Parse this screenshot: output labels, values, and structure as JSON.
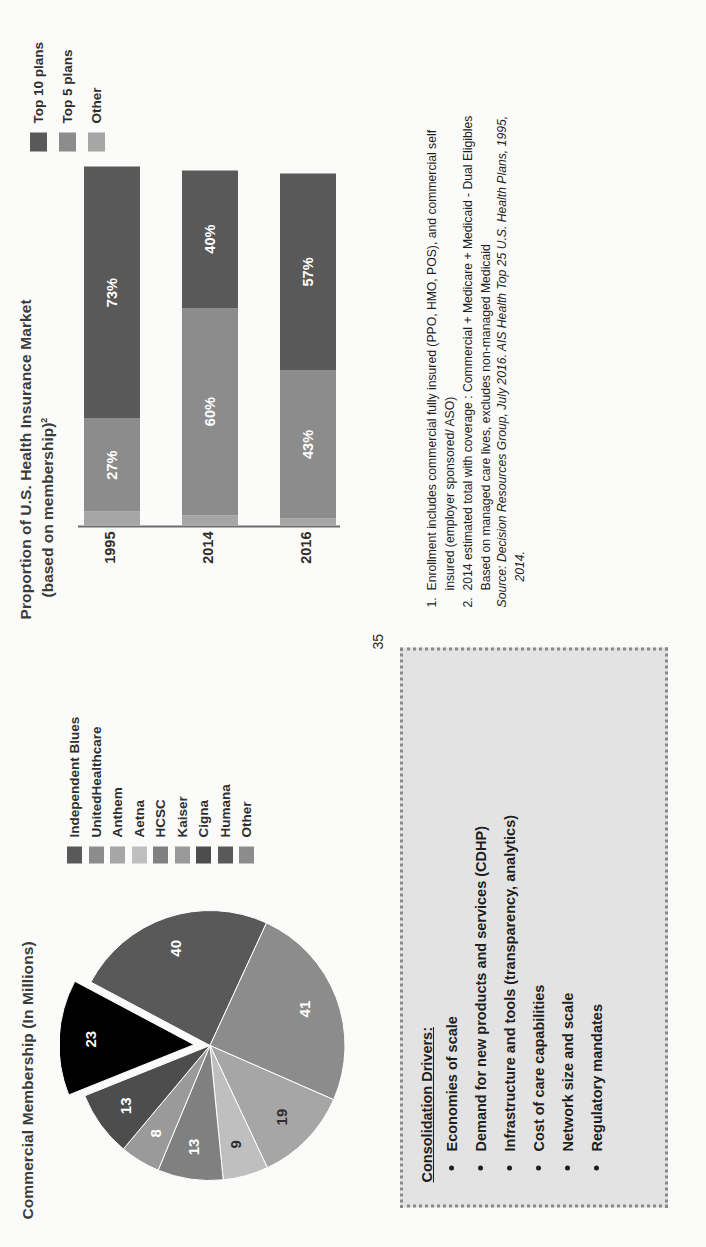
{
  "page_number": "35",
  "pie_panel": {
    "title": "Commercial Membership (In Millions)",
    "legend": [
      {
        "label": "Independent Blues",
        "color": "#595959"
      },
      {
        "label": "UnitedHealthcare",
        "color": "#8c8c8c"
      },
      {
        "label": "Anthem",
        "color": "#a6a6a6"
      },
      {
        "label": "Aetna",
        "color": "#bfbfbf"
      },
      {
        "label": "HCSC",
        "color": "#808080"
      },
      {
        "label": "Kaiser",
        "color": "#9a9a9a"
      },
      {
        "label": "Cigna",
        "color": "#4d4d4d"
      },
      {
        "label": "Humana",
        "color": "#595959"
      },
      {
        "label": "Other",
        "color": "#8c8c8c"
      }
    ]
  },
  "bar_panel": {
    "title": "Proportion of U.S. Health Insurance Market",
    "subtitle": "(based on membership)",
    "subtitle_sup": "2",
    "legend": [
      {
        "label": "Top 10 plans",
        "color": "#595959"
      },
      {
        "label": "Top 5 plans",
        "color": "#8c8c8c"
      },
      {
        "label": "Other",
        "color": "#a6a6a6"
      }
    ]
  },
  "drivers": {
    "heading": "Consolidation Drivers:",
    "items": [
      "Economies of scale",
      "Demand for new products and services (CDHP)",
      "Infrastructure and tools (transparency, analytics)",
      "Cost of care capabilities",
      "Network size and scale",
      "Regulatory mandates"
    ]
  },
  "footnotes": [
    {
      "num": "1.",
      "text": "Enrollment includes commercial fully insured (PPO, HMO, POS), and commercial self",
      "cont": "insured (employer sponsored/ ASO)"
    },
    {
      "num": "2.",
      "text": "2014 estimated total with coverage : Commercial + Medicare + Medicaid - Dual Eligibles",
      "cont": "Based on managed care lives, excludes non-managed Medicaid"
    }
  ],
  "source": {
    "line1": "Source:  Decision Resources Group, July 2016. AIS Health Top 25 U.S. Health Plans, 1995,",
    "line2": "2014."
  },
  "chart_data": [
    {
      "type": "pie",
      "title": "Commercial Membership (In Millions)",
      "unit": "millions",
      "labels": [
        "Independent Blues",
        "UnitedHealthcare",
        "Anthem",
        "Aetna",
        "HCSC",
        "Kaiser",
        "Cigna",
        "Humana",
        "Other"
      ],
      "values": [
        40,
        41,
        19,
        9,
        13,
        8,
        13,
        23,
        0
      ],
      "data_labels": [
        "40",
        "41",
        "19",
        "9",
        "13",
        "8",
        "13",
        "23",
        ""
      ],
      "colors": [
        "#595959",
        "#8c8c8c",
        "#a6a6a6",
        "#bfbfbf",
        "#808080",
        "#9a9a9a",
        "#4d4d4d",
        "#000000",
        "#8c8c8c"
      ],
      "exploded": [
        "Humana"
      ],
      "legend_position": "right"
    },
    {
      "type": "bar",
      "orientation": "horizontal-stacked",
      "title": "Proportion of U.S. Health Insurance Market",
      "subtitle": "(based on membership)2",
      "categories": [
        "1995",
        "2014",
        "2016"
      ],
      "series": [
        {
          "name": "Other",
          "values": [
            4,
            3,
            2
          ],
          "color": "#a6a6a6"
        },
        {
          "name": "Top 5 plans",
          "values": [
            27,
            60,
            43
          ],
          "color": "#8c8c8c",
          "labels": [
            "27%",
            "60%",
            "43%"
          ]
        },
        {
          "name": "Top 10 plans",
          "values": [
            73,
            40,
            57
          ],
          "color": "#595959",
          "labels": [
            "73%",
            "40%",
            "57%"
          ]
        }
      ],
      "xlabel": "",
      "ylabel": "",
      "xlim": [
        0,
        104
      ],
      "grid": false,
      "legend_position": "right"
    }
  ]
}
